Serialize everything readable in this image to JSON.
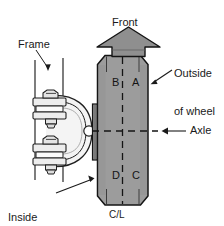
{
  "diagram": {
    "labels": {
      "front": "Front",
      "frame": "Frame",
      "outside_of_wheel_line1": "Outside",
      "outside_of_wheel_line2": "of wheel",
      "axle": "Axle",
      "inside_of_wheel_line1": "Inside",
      "inside_of_wheel_line2": "of wheel",
      "center_line": "C/L"
    },
    "quadrants": [
      {
        "id": "b",
        "label": "B",
        "position": "upper-left"
      },
      {
        "id": "a",
        "label": "A",
        "position": "upper-right"
      },
      {
        "id": "d",
        "label": "D",
        "position": "lower-left"
      },
      {
        "id": "c",
        "label": "C",
        "position": "lower-right"
      }
    ],
    "colors": {
      "wheel_fill": "#9c9c9c",
      "wheel_stroke": "#1a1a1a",
      "arrow_fill": "#8f8f8f",
      "arrow_stroke": "#1a1a1a",
      "spring_fill": "#f2f2f2",
      "spring_stroke": "#1f1f1f",
      "line": "#1a1a1a",
      "text": "#1a1a1a",
      "background": "#ffffff"
    }
  }
}
